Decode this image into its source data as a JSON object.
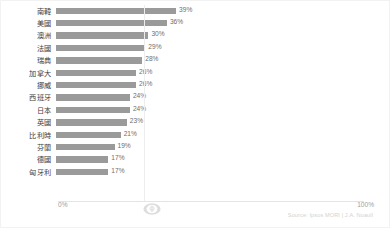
{
  "chart_data": {
    "type": "bar",
    "orientation": "horizontal",
    "title": "",
    "xlabel": "",
    "ylabel": "",
    "xlim": [
      0,
      100
    ],
    "grid": false,
    "legend": null,
    "value_suffix": "%",
    "categories": [
      "南韓",
      "美國",
      "澳洲",
      "法國",
      "瑞典",
      "加拿大",
      "挪威",
      "西班牙",
      "日本",
      "英國",
      "比利時",
      "芬蘭",
      "德國",
      "匈牙利"
    ],
    "values": [
      39,
      36,
      30,
      29,
      28,
      26,
      26,
      24,
      24,
      23,
      21,
      19,
      17,
      17
    ],
    "value_labels": [
      "39%",
      "36%",
      "30%",
      "29%",
      "28%",
      "26%",
      "26%",
      "24%",
      "24%",
      "23%",
      "21%",
      "19%",
      "17%",
      "17%"
    ],
    "axis_ticks": [
      "0%",
      "100%"
    ],
    "bar_color": "#9a9a9a",
    "label_color": "#404040",
    "value_color": "#6e6e6e"
  },
  "axis": {
    "min_label": "0%",
    "max_label": "100%"
  },
  "footer": {
    "source_note": "Source: Ipsos MORI | J.A. Noaull",
    "watermark_icon": "gem-watermark-icon"
  }
}
